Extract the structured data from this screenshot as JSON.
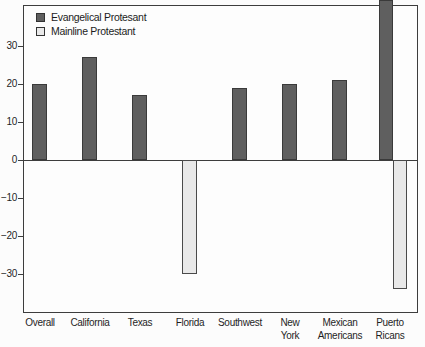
{
  "figure": {
    "background": "#fcfcfc"
  },
  "colors": {
    "evangelical_fill": "#5f5f5f",
    "evangelical_border": "#3a3a3a",
    "mainline_fill": "#e9e9e9",
    "mainline_border": "#4a4a4a",
    "axis_line": "#3d3d3d",
    "text": "#1f1f1f"
  },
  "axis": {
    "y_tick_labels": [
      "30",
      "20",
      "10",
      "0",
      "−10",
      "−20",
      "−30"
    ],
    "y_tick_values": [
      30,
      20,
      10,
      0,
      -10,
      -20,
      -30
    ],
    "x_labels": [
      [
        "Overall"
      ],
      [
        "California"
      ],
      [
        "Texas"
      ],
      [
        "Florida"
      ],
      [
        "Southwest"
      ],
      [
        "New",
        "York"
      ],
      [
        "Mexican",
        "Americans"
      ],
      [
        "Puerto",
        "Ricans"
      ]
    ]
  },
  "chart_data": {
    "type": "bar",
    "title": "",
    "xlabel": "",
    "ylabel": "",
    "categories": [
      "Overall",
      "California",
      "Texas",
      "Florida",
      "Southwest",
      "New York",
      "Mexican Americans",
      "Puerto Ricans"
    ],
    "series": [
      {
        "name": "Evangelical Protesant",
        "values": [
          20,
          27,
          17,
          null,
          19,
          20,
          21,
          42
        ]
      },
      {
        "name": "Mainline Protestant",
        "values": [
          null,
          null,
          null,
          -30,
          null,
          null,
          null,
          -34
        ]
      }
    ],
    "ylim": [
      -40,
      41
    ],
    "yticks": [
      30,
      20,
      10,
      0,
      -10,
      -20,
      -30
    ],
    "grid": false,
    "legend_position": "top-left-inside",
    "note": "Puerto Ricans Evangelical bar is clipped at the top edge of the image"
  }
}
